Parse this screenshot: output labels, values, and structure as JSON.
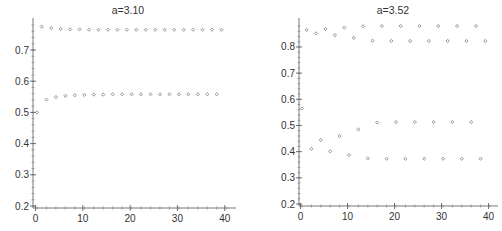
{
  "chart_data": [
    {
      "type": "scatter",
      "title": "a=3.10",
      "xlabel": "",
      "ylabel": "",
      "xlim": [
        0,
        40
      ],
      "ylim": [
        0.2,
        0.78
      ],
      "xticks": [
        0,
        10,
        20,
        30,
        40
      ],
      "xtick_labels": [
        "0",
        "10",
        "20",
        "30",
        "40"
      ],
      "yticks": [
        0.2,
        0.3,
        0.4,
        0.5,
        0.6,
        0.7
      ],
      "ytick_labels": [
        "0.2",
        "0.3",
        "0.4",
        "0.5",
        "0.6",
        "0.7"
      ],
      "grid": false,
      "legend": null,
      "marker": "small diamond/circle",
      "series": [
        {
          "name": "x_n",
          "x": [
            0,
            1,
            2,
            3,
            4,
            5,
            6,
            7,
            8,
            9,
            10,
            11,
            12,
            13,
            14,
            15,
            16,
            17,
            18,
            19,
            20,
            21,
            22,
            23,
            24,
            25,
            26,
            27,
            28,
            29,
            30,
            31,
            32,
            33,
            34,
            35,
            36,
            37,
            38,
            39
          ],
          "y": [
            0.5,
            0.775,
            0.541,
            0.77,
            0.549,
            0.767,
            0.553,
            0.766,
            0.555,
            0.766,
            0.556,
            0.765,
            0.557,
            0.765,
            0.557,
            0.765,
            0.558,
            0.765,
            0.558,
            0.765,
            0.558,
            0.765,
            0.558,
            0.765,
            0.558,
            0.765,
            0.558,
            0.765,
            0.558,
            0.765,
            0.558,
            0.765,
            0.558,
            0.765,
            0.558,
            0.765,
            0.558,
            0.765,
            0.558,
            0.765
          ]
        }
      ]
    },
    {
      "type": "scatter",
      "title": "a=3.52",
      "xlabel": "",
      "ylabel": "",
      "xlim": [
        0,
        40
      ],
      "ylim": [
        0.2,
        0.89
      ],
      "xticks": [
        0,
        10,
        20,
        30,
        40
      ],
      "xtick_labels": [
        "0",
        "10",
        "20",
        "30",
        "40"
      ],
      "yticks": [
        0.2,
        0.3,
        0.4,
        0.5,
        0.6,
        0.7,
        0.8
      ],
      "ytick_labels": [
        "0.2",
        "0.3",
        "0.4",
        "0.5",
        "0.6",
        "0.7",
        "0.8"
      ],
      "grid": false,
      "legend": null,
      "marker": "small diamond/circle",
      "series": [
        {
          "name": "x_n",
          "x": [
            0,
            1,
            2,
            3,
            4,
            5,
            6,
            7,
            8,
            9,
            10,
            11,
            12,
            13,
            14,
            15,
            16,
            17,
            18,
            19,
            20,
            21,
            22,
            23,
            24,
            25,
            26,
            27,
            28,
            29,
            30,
            31,
            32,
            33,
            34,
            35,
            36,
            37,
            38,
            39
          ],
          "y": [
            0.565,
            0.865,
            0.411,
            0.852,
            0.444,
            0.869,
            0.401,
            0.845,
            0.46,
            0.874,
            0.387,
            0.835,
            0.485,
            0.879,
            0.374,
            0.824,
            0.511,
            0.88,
            0.373,
            0.823,
            0.513,
            0.88,
            0.373,
            0.823,
            0.513,
            0.88,
            0.373,
            0.823,
            0.513,
            0.88,
            0.373,
            0.823,
            0.513,
            0.88,
            0.373,
            0.823,
            0.513,
            0.88,
            0.373,
            0.823
          ]
        }
      ]
    }
  ],
  "layout": [
    {
      "axis_x": 33,
      "axis_y": 208,
      "top": 18,
      "right": 236,
      "px0": 37,
      "pxs": 4.73,
      "py_ref_v": 0.2,
      "py_ref": 206,
      "pys": 312,
      "title_x": 128,
      "title_y": 14
    },
    {
      "axis_x": 299,
      "axis_y": 206,
      "top": 18,
      "right": 498,
      "px0": 302,
      "pxs": 4.7,
      "py_ref_v": 0.2,
      "py_ref": 204,
      "pys": 261.7,
      "title_x": 393,
      "title_y": 14
    }
  ],
  "colors": {
    "axis": "#555555",
    "marker": "#8a8a8a",
    "text": "#333333",
    "background": "#ffffff"
  }
}
